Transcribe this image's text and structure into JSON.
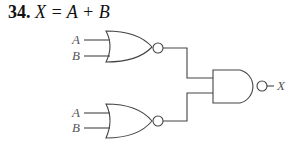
{
  "problem": {
    "number": "34.",
    "equation": "X = A + B"
  },
  "diagram": {
    "gates": [
      {
        "id": "nor-top",
        "type": "NOR",
        "inputs": [
          "A",
          "B"
        ]
      },
      {
        "id": "nor-bottom",
        "type": "NOR",
        "inputs": [
          "A",
          "B"
        ]
      },
      {
        "id": "nand-out",
        "type": "NAND",
        "inputs": [
          "nor-top",
          "nor-bottom"
        ],
        "output": "X"
      }
    ],
    "labels": {
      "top_a": "A",
      "top_b": "B",
      "bottom_a": "A",
      "bottom_b": "B",
      "output": "X"
    },
    "colors": {
      "stroke": "#444444",
      "label": "#555555"
    }
  }
}
